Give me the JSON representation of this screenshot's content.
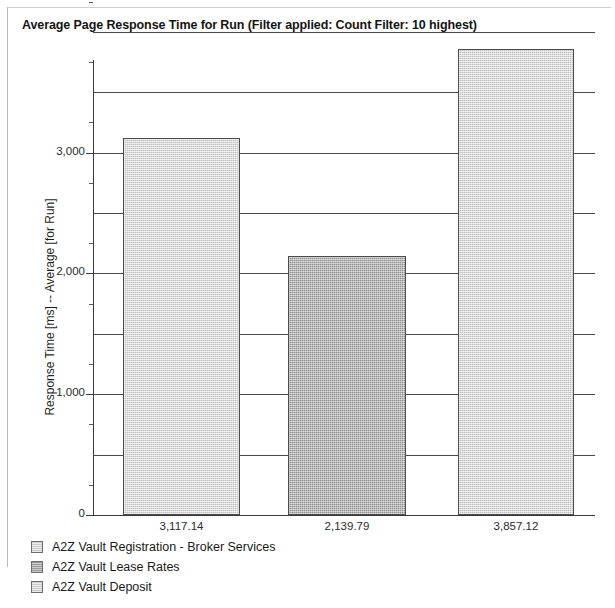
{
  "chart_data": {
    "type": "bar",
    "title": "Average Page Response Time for Run (Filter applied: Count Filter: 10 highest)",
    "xlabel": "",
    "ylabel": "Response Time [ms] -- Average [for Run]",
    "ylim": [
      0,
      4250
    ],
    "grid": true,
    "grid_interval": 500,
    "tick_interval": 250,
    "legend_position": "bottom-left",
    "categories": [
      "A2Z Vault Registration - Broker Services",
      "A2Z Vault Lease Rates",
      "A2Z Vault Deposit"
    ],
    "values": [
      3117.14,
      2139.79,
      3857.12
    ],
    "value_labels": [
      "3,117.14",
      "2,139.79",
      "3,857.12"
    ],
    "bar_colors": [
      "#d3d3d3",
      "#a6a6a6",
      "#d3d3d3"
    ],
    "ytick_labels": [
      "0",
      "1,000",
      "2,000",
      "3,000"
    ],
    "ytick_values": [
      0,
      1000,
      2000,
      3000
    ],
    "gridline_values": [
      500,
      1000,
      1500,
      2000,
      2500,
      3000,
      3500,
      4000
    ],
    "minor_tick_values": [
      250,
      750,
      1250,
      1750,
      2250,
      2750,
      3250,
      3750,
      4250
    ]
  },
  "legend": {
    "items": [
      {
        "label": "A2Z Vault Registration - Broker Services",
        "swatch": "light"
      },
      {
        "label": "A2Z Vault Lease Rates",
        "swatch": "dark"
      },
      {
        "label": "A2Z Vault Deposit",
        "swatch": "light"
      }
    ]
  },
  "colors": {
    "bar_light": "#d3d3d3",
    "bar_dark": "#a6a6a6",
    "bar_border": "#4d4d4d",
    "axis": "#3a3a3a",
    "grid": "#4a4a4a",
    "text": "#1a1a1a",
    "frame": "#b9b9b9",
    "background": "#ffffff"
  }
}
